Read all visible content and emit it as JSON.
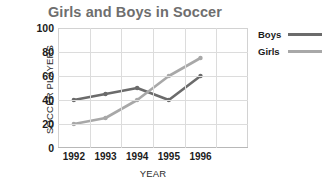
{
  "chart_data": {
    "type": "line",
    "title": "Girls and Boys in Soccer",
    "xlabel": "YEAR",
    "ylabel": "SOCCER PLAYERS",
    "categories": [
      "1992",
      "1993",
      "1994",
      "1995",
      "1996"
    ],
    "series": [
      {
        "name": "Boys",
        "values": [
          40,
          45,
          50,
          40,
          60
        ],
        "color": "#6b6b6b"
      },
      {
        "name": "Girls",
        "values": [
          20,
          25,
          40,
          60,
          75
        ],
        "color": "#a8a8a8"
      }
    ],
    "ylim": [
      0,
      100
    ],
    "yticks": [
      "0",
      "20",
      "40",
      "60",
      "80",
      "100"
    ],
    "grid": true,
    "legend_position": "right"
  },
  "legend": {
    "entries": [
      {
        "label": "Boys"
      },
      {
        "label": "Girls"
      }
    ]
  },
  "colors": {
    "boys": "#6b6b6b",
    "girls": "#a8a8a8",
    "title": "#6e6e6e",
    "grid": "#dcdcdc",
    "frame": "#d2d2d2",
    "text": "#1b1b1b"
  }
}
